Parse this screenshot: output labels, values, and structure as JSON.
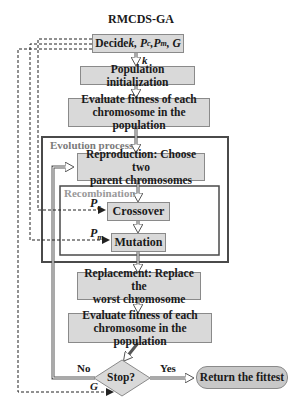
{
  "title": "RMCDS-GA",
  "nodes": {
    "decide": {
      "prefix": "Decide ",
      "params": "k, P",
      "pc_sub": "c",
      "sep": " ,P",
      "pm_sub": "m",
      "suffix": ", G"
    },
    "init": "Population initialization",
    "evaluate1": {
      "line1": "Evaluate fitness of each",
      "line2": "chromosome in the population"
    },
    "reproduction": {
      "line1": "Reproduction: Choose two",
      "line2": "parent chromosomes"
    },
    "crossover": "Crossover",
    "mutation": "Mutation",
    "replacement": {
      "line1": "Replacement: Replace the",
      "line2": "worst chromosome"
    },
    "evaluate2": {
      "line1": "Evaluate fitness of each",
      "line2": "chromosome in the population"
    },
    "stop": "Stop?",
    "return": "Return the fittest"
  },
  "frames": {
    "evolution": "Evolution process",
    "recombination": "Recombination"
  },
  "edge_labels": {
    "k": "k",
    "pc": "P",
    "pc_sub": "c",
    "pm": "P",
    "pm_sub": "m",
    "no": "No",
    "yes": "Yes",
    "g": "G"
  },
  "colors": {
    "box_fill": "#d9d9d9",
    "box_border": "#8a8a8a",
    "frame_border": "#4a4a4a",
    "frame_label": "#7a7a7a",
    "arrow": "#555555"
  }
}
